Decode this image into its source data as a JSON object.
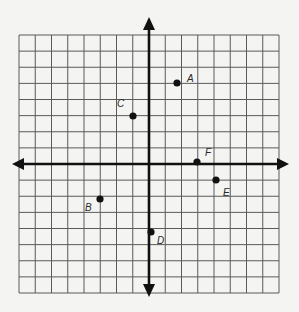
{
  "figure": {
    "type": "coordinate-plane",
    "background": "#f4f4f2",
    "grid_color": "#5a5a5a",
    "axis_color": "#111111",
    "point_color": "#111111",
    "grid": {
      "cells_x": 16,
      "cells_y": 16,
      "x_range": [
        -8,
        8
      ],
      "y_range": [
        -8,
        8
      ]
    },
    "axes": {
      "x_arrows": "both",
      "y_arrows": "both"
    }
  },
  "points": [
    {
      "label": "A",
      "x": 2,
      "y": 5
    },
    {
      "label": "B",
      "x": -3,
      "y": -2
    },
    {
      "label": "C",
      "x": -1,
      "y": 3
    },
    {
      "label": "D",
      "x": 0,
      "y": -4
    },
    {
      "label": "E",
      "x": 4,
      "y": -1
    },
    {
      "label": "F",
      "x": 3,
      "y": 0
    }
  ],
  "labels": {
    "A": "A",
    "B": "B",
    "C": "C",
    "D": "D",
    "E": "E",
    "F": "F"
  }
}
